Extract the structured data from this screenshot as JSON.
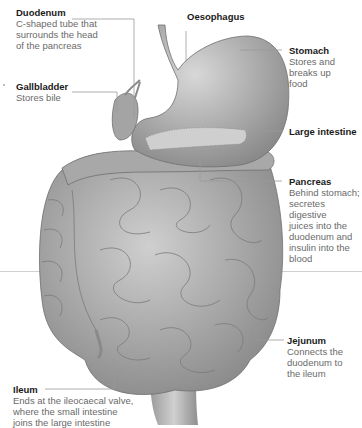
{
  "diagram": {
    "labels": {
      "duodenum": {
        "title": "Duodenum",
        "desc_lines": [
          "C-shaped tube that",
          "surrounds the head",
          "of the pancreas"
        ]
      },
      "oesophagus": {
        "title": "Oesophagus"
      },
      "stomach": {
        "title": "Stomach",
        "desc_lines": [
          "Stores and",
          "breaks up",
          "food"
        ]
      },
      "gallbladder": {
        "title": "Gallbladder",
        "desc_lines": [
          "Stores bile"
        ]
      },
      "large_intestine": {
        "title": "Large intestine"
      },
      "pancreas": {
        "title": "Pancreas",
        "desc_lines": [
          "Behind stomach;",
          "secretes digestive",
          "juices into the",
          "duodenum and",
          "insulin into the",
          "blood"
        ]
      },
      "jejunum": {
        "title": "Jejunum",
        "desc_lines": [
          "Connects the",
          "duodenum to",
          "the ileum"
        ]
      },
      "ileum": {
        "title": "Ileum",
        "desc_lines": [
          "Ends at the ileocaecal valve,",
          "where the small intestine",
          "joins the large intestine"
        ]
      }
    },
    "colors": {
      "title_text": "#1a1a1a",
      "desc_text": "#6a6a6a",
      "leader_line": "#9a9a9a",
      "organ_fill": "#b8b8b8",
      "organ_shadow": "#7e7e7e"
    }
  }
}
